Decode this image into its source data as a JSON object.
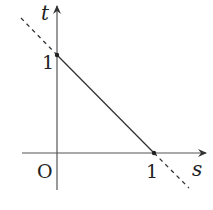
{
  "diagram": {
    "type": "coordinate-graph",
    "axes": {
      "x_label": "s",
      "y_label": "t",
      "origin_label": "O"
    },
    "ticks": {
      "x_tick_label": "1",
      "y_tick_label": "1"
    },
    "points": [
      {
        "name": "y-intercept",
        "x": 0,
        "y": 1
      },
      {
        "name": "x-intercept",
        "x": 1,
        "y": 0
      }
    ],
    "line": {
      "equation": "s + t = 1",
      "solid_segment": "from (0,1) to (1,0)",
      "dashed_extension": "beyond both intercepts"
    },
    "colors": {
      "line": "#333333",
      "axes": "#555555",
      "background": "#ffffff"
    }
  }
}
